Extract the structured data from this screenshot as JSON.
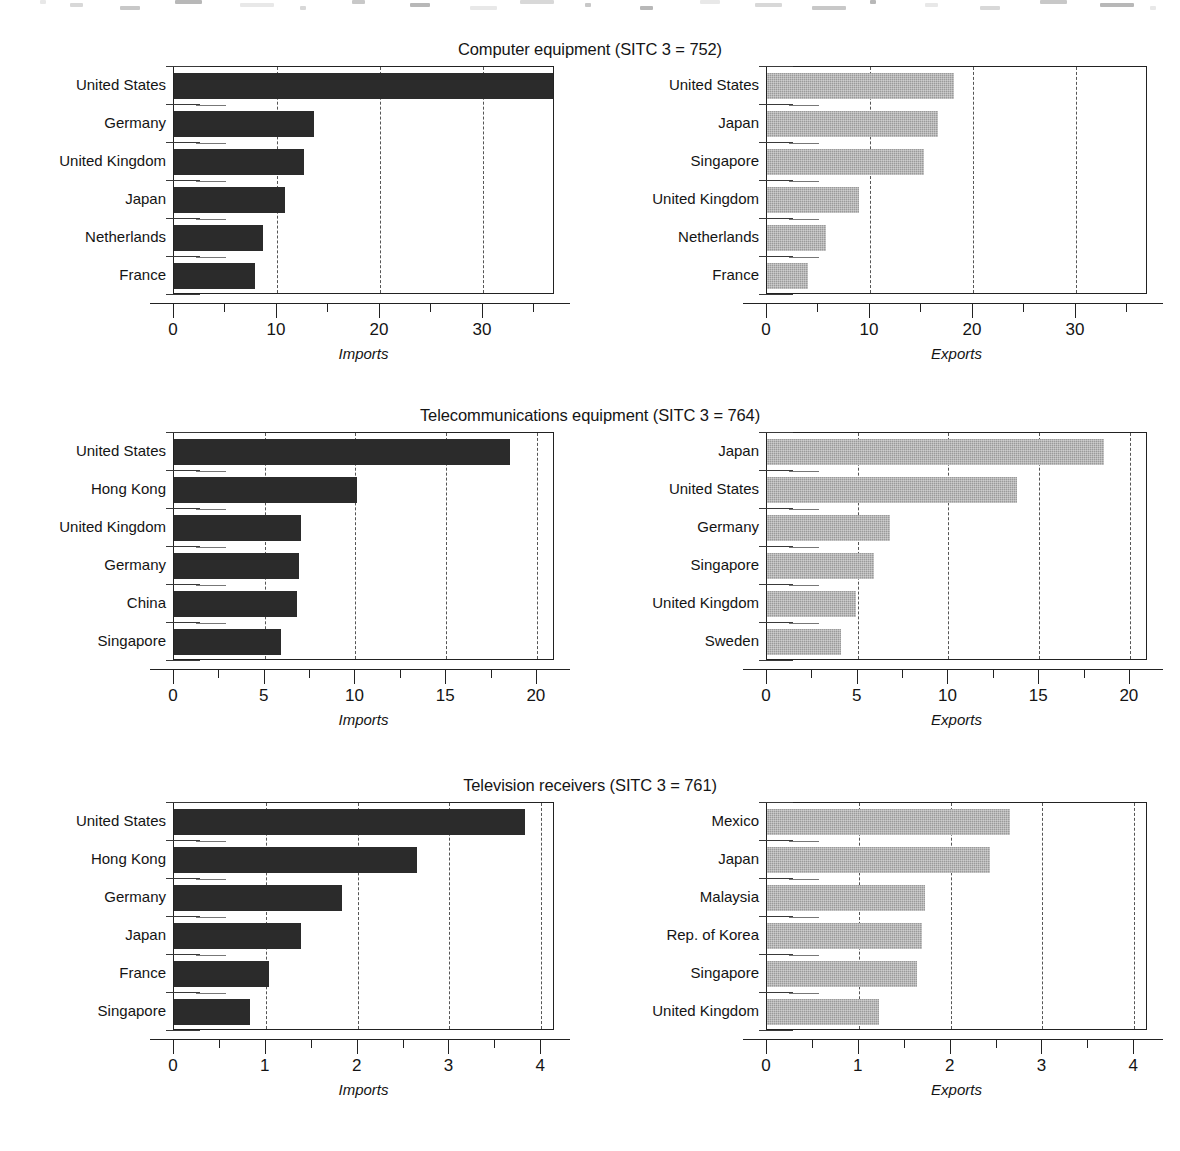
{
  "page": {
    "panel_captions": {
      "imports": "Imports",
      "exports": "Exports"
    }
  },
  "colors": {
    "imports_bar": "#2b2b2b",
    "exports_bar": "#9a9a9a",
    "axis": "#222222",
    "gridline": "#555555",
    "text": "#141414",
    "background": "#ffffff"
  },
  "chart_data": [
    {
      "type": "bar",
      "title": "Computer equipment (SITC 3 = 752)",
      "orientation": "horizontal",
      "grid": true,
      "panels": [
        {
          "name": "imports",
          "xlabel": "Imports",
          "ylabel": "",
          "xlim": [
            0,
            37
          ],
          "xticks_major": [
            0,
            10,
            20,
            30
          ],
          "xticks_minor": [
            5,
            15,
            25,
            35
          ],
          "xticklabels": [
            "0",
            "10",
            "20",
            "30"
          ],
          "categories": [
            "United States",
            "Germany",
            "United Kingdom",
            "Japan",
            "Netherlands",
            "France"
          ],
          "values": [
            36.8,
            13.6,
            12.6,
            10.8,
            8.6,
            7.9
          ]
        },
        {
          "name": "exports",
          "xlabel": "Exports",
          "ylabel": "",
          "xlim": [
            0,
            37
          ],
          "xticks_major": [
            0,
            10,
            20,
            30
          ],
          "xticks_minor": [
            5,
            15,
            25,
            35
          ],
          "xticklabels": [
            "0",
            "10",
            "20",
            "30"
          ],
          "categories": [
            "United States",
            "Japan",
            "Singapore",
            "United Kingdom",
            "Netherlands",
            "France"
          ],
          "values": [
            18.2,
            16.6,
            15.2,
            8.9,
            5.7,
            4.0
          ]
        }
      ]
    },
    {
      "type": "bar",
      "title": "Telecommunications equipment (SITC 3 = 764)",
      "orientation": "horizontal",
      "grid": true,
      "panels": [
        {
          "name": "imports",
          "xlabel": "Imports",
          "ylabel": "",
          "xlim": [
            0,
            21
          ],
          "xticks_major": [
            0,
            5,
            10,
            15,
            20
          ],
          "xticks_minor": [
            2.5,
            7.5,
            12.5,
            17.5
          ],
          "xticklabels": [
            "0",
            "5",
            "10",
            "15",
            "20"
          ],
          "categories": [
            "United States",
            "Hong Kong",
            "United Kingdom",
            "Germany",
            "China",
            "Singapore"
          ],
          "values": [
            18.5,
            10.1,
            7.0,
            6.9,
            6.8,
            5.9
          ]
        },
        {
          "name": "exports",
          "xlabel": "Exports",
          "ylabel": "",
          "xlim": [
            0,
            21
          ],
          "xticks_major": [
            0,
            5,
            10,
            15,
            20
          ],
          "xticks_minor": [
            2.5,
            7.5,
            12.5,
            17.5
          ],
          "xticklabels": [
            "0",
            "5",
            "10",
            "15",
            "20"
          ],
          "categories": [
            "Japan",
            "United States",
            "Germany",
            "Singapore",
            "United Kingdom",
            "Sweden"
          ],
          "values": [
            18.6,
            13.8,
            6.8,
            5.9,
            4.9,
            4.1
          ]
        }
      ]
    },
    {
      "type": "bar",
      "title": "Television receivers (SITC 3 = 761)",
      "orientation": "horizontal",
      "grid": true,
      "panels": [
        {
          "name": "imports",
          "xlabel": "Imports",
          "ylabel": "",
          "xlim": [
            0,
            4.15
          ],
          "xticks_major": [
            0,
            1,
            2,
            3,
            4
          ],
          "xticks_minor": [
            0.5,
            1.5,
            2.5,
            3.5
          ],
          "xticklabels": [
            "0",
            "1",
            "2",
            "3",
            "4"
          ],
          "categories": [
            "United States",
            "Hong Kong",
            "Germany",
            "Japan",
            "France",
            "Singapore"
          ],
          "values": [
            3.82,
            2.65,
            1.83,
            1.38,
            1.04,
            0.83
          ]
        },
        {
          "name": "exports",
          "xlabel": "Exports",
          "ylabel": "",
          "xlim": [
            0,
            4.15
          ],
          "xticks_major": [
            0,
            1,
            2,
            3,
            4
          ],
          "xticks_minor": [
            0.5,
            1.5,
            2.5,
            3.5
          ],
          "xticklabels": [
            "0",
            "1",
            "2",
            "3",
            "4"
          ],
          "categories": [
            "Mexico",
            "Japan",
            "Malaysia",
            "Rep. of Korea",
            "Singapore",
            "United Kingdom"
          ],
          "values": [
            2.65,
            2.43,
            1.72,
            1.69,
            1.63,
            1.22
          ]
        }
      ]
    }
  ]
}
